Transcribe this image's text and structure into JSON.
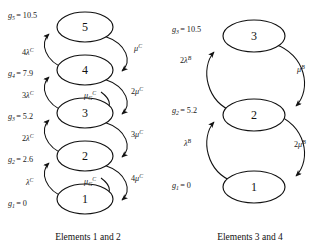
{
  "figure": {
    "type": "markov-state-transition-diagram",
    "background_color": "#ffffff",
    "stroke_color": "#111111"
  },
  "diagrams": [
    {
      "id": "left",
      "caption": "Elements 1 and 2",
      "states": [
        {
          "label": "5",
          "value_label": "g",
          "value_sub": "5",
          "value_text": "= 10.5"
        },
        {
          "label": "4",
          "value_label": "g",
          "value_sub": "4",
          "value_text": "= 7.9"
        },
        {
          "label": "3",
          "value_label": "g",
          "value_sub": "3",
          "value_text": "= 5.2"
        },
        {
          "label": "2",
          "value_label": "g",
          "value_sub": "2",
          "value_text": "= 2.6"
        },
        {
          "label": "1",
          "value_label": "g",
          "value_sub": "1",
          "value_text": "= 0"
        }
      ],
      "up_rates": [
        {
          "coef": "4",
          "sym": "λ",
          "sup": "C"
        },
        {
          "coef": "3",
          "sym": "λ",
          "sup": "C"
        },
        {
          "coef": "2",
          "sym": "λ",
          "sup": "C"
        },
        {
          "coef": "",
          "sym": "λ",
          "sup": "C"
        }
      ],
      "down_rates": [
        {
          "coef": "",
          "sym": "μ",
          "sup": "C"
        },
        {
          "coef": "2",
          "sym": "μ",
          "sup": "C"
        },
        {
          "coef": "3",
          "sym": "μ",
          "sup": "C"
        },
        {
          "coef": "4",
          "sym": "μ",
          "sup": "C"
        }
      ],
      "group_rates": [
        {
          "sym": "μ",
          "sub": "G",
          "sup": "C"
        },
        {
          "sym": "μ",
          "sub": "G",
          "sup": "C"
        }
      ]
    },
    {
      "id": "right",
      "caption": "Elements 3 and 4",
      "states": [
        {
          "label": "3",
          "value_label": "g",
          "value_sub": "3",
          "value_text": "= 10.5"
        },
        {
          "label": "2",
          "value_label": "g",
          "value_sub": "2",
          "value_text": "= 5.2"
        },
        {
          "label": "1",
          "value_label": "g",
          "value_sub": "1",
          "value_text": "= 0"
        }
      ],
      "up_rates": [
        {
          "coef": "2",
          "sym": "λ",
          "sup": "B"
        },
        {
          "coef": "",
          "sym": "λ",
          "sup": "B"
        }
      ],
      "down_rates": [
        {
          "coef": "",
          "sym": "μ",
          "sup": "B"
        },
        {
          "coef": "2",
          "sym": "μ",
          "sup": "B"
        }
      ]
    }
  ]
}
